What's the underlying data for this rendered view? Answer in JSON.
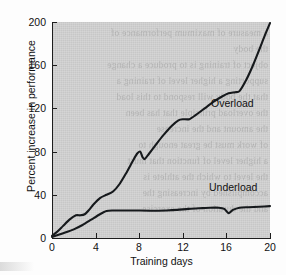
{
  "chart_data": {
    "type": "line",
    "title": "",
    "xlabel": "Training days",
    "ylabel": "Percent increase in performance",
    "xlim": [
      0,
      20
    ],
    "ylim": [
      0,
      200
    ],
    "xticks": [
      0,
      4,
      8,
      12,
      16,
      20
    ],
    "yticks": [
      0,
      40,
      80,
      120,
      160,
      200
    ],
    "xtick_labels": [
      "0",
      "4",
      "8",
      "12",
      "16",
      "20"
    ],
    "ytick_labels": [
      "0",
      "40",
      "80",
      "120",
      "160",
      "200"
    ],
    "grid": false,
    "legend_position": "inline-annotation",
    "series": [
      {
        "name": "Overload",
        "label": "Overload",
        "color": "#16191c",
        "label_x": 14.6,
        "label_y": 124,
        "x": [
          0,
          0.5,
          1.0,
          1.6,
          2.2,
          2.6,
          3.0,
          3.4,
          3.8,
          4.4,
          5.0,
          5.6,
          6.2,
          6.8,
          7.4,
          7.8,
          8.1,
          8.3,
          8.5,
          8.9,
          9.5,
          10.2,
          11.0,
          11.6,
          12.0,
          12.6,
          13.2,
          14.0,
          14.8,
          15.6,
          16.2,
          16.8,
          17.2,
          17.8,
          18.4,
          19.0,
          19.5,
          20.0
        ],
        "y": [
          2,
          6,
          11,
          17,
          21,
          21,
          22,
          26,
          31,
          37,
          40,
          43,
          50,
          60,
          71,
          78,
          80,
          75,
          73,
          78,
          86,
          95,
          104,
          109,
          110,
          110,
          114,
          120,
          126,
          131,
          134,
          135,
          136,
          146,
          159,
          174,
          187,
          199
        ]
      },
      {
        "name": "Underload",
        "label": "Underload",
        "color": "#16191c",
        "label_x": 14.4,
        "label_y": 46,
        "x": [
          0,
          0.6,
          1.2,
          2.0,
          2.8,
          3.6,
          4.4,
          5.0,
          5.6,
          6.4,
          7.5,
          9.0,
          10.5,
          11.5,
          12.5,
          13.5,
          14.5,
          15.3,
          15.8,
          16.2,
          16.6,
          17.2,
          18.0,
          19.0,
          20.0
        ],
        "y": [
          1,
          3,
          5,
          8,
          12,
          17,
          22,
          25,
          25.5,
          25.5,
          25.5,
          25.3,
          25.5,
          26,
          27,
          27.5,
          28,
          28,
          27,
          23,
          26,
          28,
          28.5,
          29,
          29.5
        ]
      }
    ],
    "annotations": [
      {
        "text": "Overload",
        "x": 14.6,
        "y": 124
      },
      {
        "text": "Underload",
        "x": 14.4,
        "y": 46
      }
    ]
  },
  "figure": {
    "background_color": "#cfcfcf",
    "page_color": "#fdfdfd",
    "line_color": "#16191c",
    "axis_color": "#1d1d1d",
    "text_color": "#111111"
  },
  "bleed_text": {
    "lines": [
      "a measure of maximum performance of",
      "the body",
      "object of training is to produce a change",
      "supporting a higher level of training a",
      "that the body will respond to this load",
      "the overload principle that has been",
      "the amount and the increase",
      "of work must be great enough to",
      "a higher level of function that must",
      "the level to which the athlete is",
      "accomplished by increasing the",
      "and the duration of the exercise"
    ]
  }
}
